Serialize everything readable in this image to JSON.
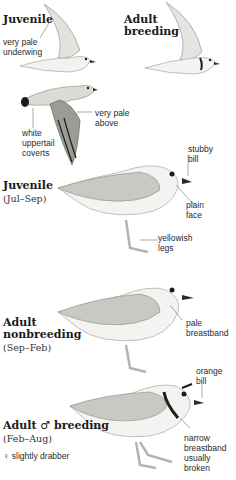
{
  "plate": {
    "figures": [
      {
        "id": "juvenile-flight",
        "title": "Juvenile",
        "notes": [
          "very pale",
          "underwing"
        ]
      },
      {
        "id": "adult-breeding-flight",
        "title_line1": "Adult",
        "title_line2": "breeding"
      },
      {
        "id": "upperwing-flight",
        "notes_right": [
          "very pale",
          "above"
        ],
        "notes_left": [
          "white",
          "uppertail",
          "coverts"
        ]
      },
      {
        "id": "juvenile-standing",
        "title": "Juvenile",
        "season": "(Jul–Sep)",
        "note_bill": [
          "stubby",
          "bill"
        ],
        "note_face": [
          "plain",
          "face"
        ],
        "note_legs": [
          "yellowish",
          "legs"
        ]
      },
      {
        "id": "adult-nonbreeding-standing",
        "title_line1": "Adult",
        "title_line2": "nonbreeding",
        "season": "(Sep–Feb)",
        "note_breast": [
          "pale",
          "breastband"
        ]
      },
      {
        "id": "adult-male-breeding-standing",
        "title": "Adult ♂ breeding",
        "season": "(Feb–Aug)",
        "female_note": "♀ slightly drabber",
        "note_bill": [
          "orange",
          "bill"
        ],
        "note_breast": [
          "narrow",
          "breastband",
          "usually",
          "broken"
        ]
      }
    ],
    "colors": {
      "background": "#ffffff",
      "plumage_upper": "#c9c9c4",
      "plumage_shadow": "#a9a9a4",
      "plumage_white": "#f4f4f2",
      "dark_mark": "#1c1c1c",
      "leg": "#b4b4ae",
      "text": "#1a1a1a"
    }
  }
}
